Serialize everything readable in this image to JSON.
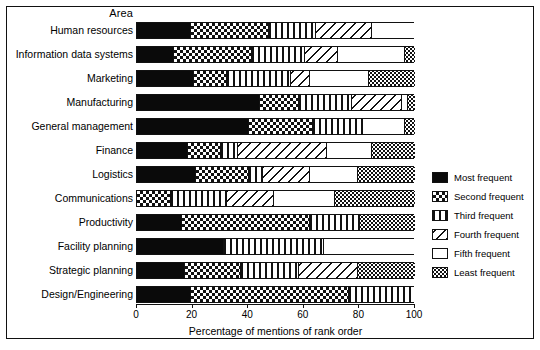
{
  "header": {
    "area_label": "Area"
  },
  "axis": {
    "xlabel": "Percentage of mentions of rank order",
    "ticks": [
      "0",
      "20",
      "40",
      "60",
      "80",
      "100"
    ]
  },
  "legend": {
    "items": [
      {
        "label": "Most frequent",
        "pattern": "solid-black",
        "key": "most"
      },
      {
        "label": "Second frequent",
        "pattern": "checkerboard",
        "key": "second"
      },
      {
        "label": "Third frequent",
        "pattern": "vertical-lines",
        "key": "third"
      },
      {
        "label": "Fourth frequent",
        "pattern": "diagonal-hatch",
        "key": "fourth"
      },
      {
        "label": "Fifth frequent",
        "pattern": "white-empty",
        "key": "fifth"
      },
      {
        "label": "Least frequent",
        "pattern": "fine-dots",
        "key": "least"
      }
    ]
  },
  "chart_data": {
    "type": "bar",
    "orientation": "horizontal",
    "stacked": true,
    "title": "",
    "xlabel": "Percentage of mentions of rank order",
    "ylabel": "Area",
    "xlim": [
      0,
      100
    ],
    "xticks": [
      0,
      20,
      40,
      60,
      80,
      100
    ],
    "grid": false,
    "legend_position": "right",
    "categories": [
      "Human resources",
      "Information data systems",
      "Marketing",
      "Manufacturing",
      "General management",
      "Finance",
      "Logistics",
      "Communications",
      "Productivity",
      "Facility planning",
      "Strategic planning",
      "Design/Engineering"
    ],
    "series": [
      {
        "name": "Most frequent",
        "values": [
          19,
          13,
          20,
          44,
          40,
          18,
          21,
          0,
          16,
          31,
          17,
          19
        ]
      },
      {
        "name": "Second frequent",
        "values": [
          28,
          28,
          12,
          14,
          23,
          12,
          19,
          12,
          46,
          0,
          20,
          57
        ]
      },
      {
        "name": "Third frequent",
        "values": [
          17,
          19,
          23,
          19,
          18,
          6,
          5,
          20,
          18,
          36,
          21,
          24
        ]
      },
      {
        "name": "Fourth frequent",
        "values": [
          20,
          12,
          7,
          18,
          0,
          32,
          17,
          17,
          0,
          0,
          21,
          0
        ]
      },
      {
        "name": "Fifth frequent",
        "values": [
          16,
          24,
          21,
          2,
          15,
          16,
          17,
          22,
          0,
          33,
          0,
          0
        ]
      },
      {
        "name": "Least frequent",
        "values": [
          0,
          4,
          17,
          3,
          4,
          16,
          21,
          29,
          20,
          0,
          21,
          0
        ]
      }
    ]
  }
}
